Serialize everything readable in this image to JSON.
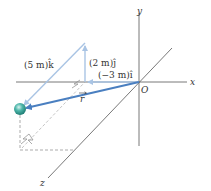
{
  "diagram": {
    "axes": {
      "x_label": "x",
      "y_label": "y",
      "z_label": "z",
      "origin_label": "O"
    },
    "vectors": {
      "k_component": "(5 m)k̂",
      "j_component": "(2 m)ĵ",
      "i_component": "(−3 m)î",
      "position_vector": "r"
    },
    "colors": {
      "axis": "#333333",
      "component_vector": "#a9c4e4",
      "position_vector": "#4a7fc0",
      "sphere": "#3aa39a",
      "dashed": "#777777"
    }
  }
}
